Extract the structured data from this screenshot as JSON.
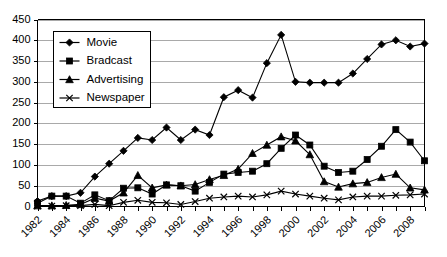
{
  "chart_data": {
    "type": "line",
    "title": "",
    "xlabel": "",
    "ylabel": "",
    "ylim": [
      0,
      450
    ],
    "ytick_step": 50,
    "y_ticks": [
      "0",
      "50",
      "100",
      "150",
      "200",
      "250",
      "300",
      "350",
      "400",
      "450"
    ],
    "grid": true,
    "legend_position": "upper-left-inside",
    "x": [
      1982,
      1983,
      1984,
      1985,
      1986,
      1987,
      1988,
      1989,
      1990,
      1991,
      1992,
      1993,
      1994,
      1995,
      1996,
      1997,
      1998,
      1999,
      2000,
      2001,
      2002,
      2003,
      2004,
      2005,
      2006,
      2007,
      2008,
      2009
    ],
    "x_tick_labels": [
      "1982",
      "1984",
      "1986",
      "1988",
      "1990",
      "1992",
      "1994",
      "1996",
      "1998",
      "2000",
      "2002",
      "2004",
      "2006",
      "2008"
    ],
    "x_tick_label_years": [
      1982,
      1984,
      1986,
      1988,
      1990,
      1992,
      1994,
      1996,
      1998,
      2000,
      2002,
      2004,
      2006,
      2008
    ],
    "series": [
      {
        "name": "Movie",
        "marker": "diamond",
        "values": [
          13,
          25,
          25,
          33,
          72,
          103,
          134,
          165,
          160,
          190,
          160,
          185,
          172,
          263,
          280,
          262,
          345,
          413,
          300,
          298,
          298,
          298,
          320,
          355,
          390,
          400,
          385,
          392
        ]
      },
      {
        "name": "Bradcast",
        "marker": "square",
        "values": [
          8,
          25,
          25,
          8,
          28,
          14,
          44,
          45,
          30,
          52,
          50,
          37,
          58,
          78,
          82,
          85,
          103,
          140,
          172,
          148,
          97,
          82,
          85,
          113,
          145,
          185,
          155,
          110
        ]
      },
      {
        "name": "Advertising",
        "marker": "triangle",
        "values": [
          2,
          2,
          3,
          5,
          20,
          13,
          33,
          75,
          45,
          52,
          50,
          53,
          65,
          75,
          90,
          128,
          148,
          168,
          158,
          125,
          60,
          47,
          55,
          58,
          70,
          78,
          45,
          40
        ]
      },
      {
        "name": "Newspaper",
        "marker": "cross",
        "values": [
          1,
          1,
          2,
          2,
          5,
          2,
          10,
          15,
          10,
          9,
          5,
          12,
          20,
          23,
          25,
          23,
          28,
          37,
          30,
          25,
          20,
          16,
          23,
          25,
          25,
          27,
          28,
          30
        ]
      }
    ]
  },
  "legend": {
    "items": [
      {
        "label": "Movie"
      },
      {
        "label": "Bradcast"
      },
      {
        "label": "Advertising"
      },
      {
        "label": "Newspaper"
      }
    ]
  },
  "colors": {
    "series": "#000000",
    "grid": "#a9a9a9",
    "axis": "#000000",
    "background": "#ffffff"
  }
}
